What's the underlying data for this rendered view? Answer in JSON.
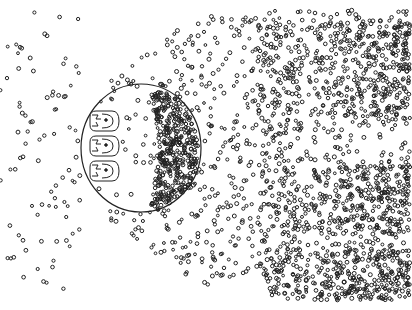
{
  "illustration": {
    "width": 412,
    "height": 310,
    "background": "#ffffff",
    "ink": "#222222",
    "description": "Stipple drawing of a round cell containing three small organisms, with particles streaming away to the right in dense bands",
    "cell": {
      "cx": 141,
      "cy": 148,
      "rx": 60,
      "ry": 64,
      "stroke": "#222222"
    },
    "organisms": [
      {
        "x": 104,
        "y": 121
      },
      {
        "x": 104,
        "y": 146
      },
      {
        "x": 104,
        "y": 171
      }
    ],
    "dot_radius": 1.7,
    "dot_stroke": 1.0,
    "regions": [
      {
        "name": "sparse-left",
        "x0": 0,
        "x1": 80,
        "y0": 10,
        "y1": 290,
        "count": 90
      },
      {
        "name": "scatter-mid",
        "x0": 110,
        "x1": 300,
        "y0": 15,
        "y1": 285,
        "count": 700
      },
      {
        "name": "scatter-right",
        "x0": 260,
        "x1": 410,
        "y0": 10,
        "y1": 300,
        "count": 650
      },
      {
        "name": "cell-crescent",
        "cx": 160,
        "cy": 150,
        "rx": 38,
        "ry": 58,
        "count": 420
      },
      {
        "name": "band-top-right",
        "x0": 310,
        "x1": 410,
        "y0": 20,
        "y1": 120,
        "count": 420
      },
      {
        "name": "band-mid-right",
        "x0": 300,
        "x1": 410,
        "y0": 165,
        "y1": 235,
        "count": 330
      },
      {
        "name": "band-bottom-right",
        "x0": 270,
        "x1": 410,
        "y0": 250,
        "y1": 300,
        "count": 340
      }
    ]
  }
}
